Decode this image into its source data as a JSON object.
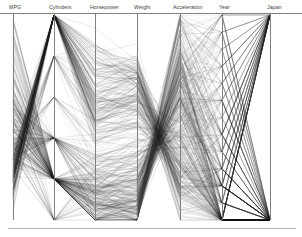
{
  "figure": {
    "kind": "parallel-coordinates-plot",
    "background_color": "#ffffff",
    "line_color": "#1d1d1d",
    "axis_color": "#7a7a7a",
    "label_color": "#3a3a3a"
  },
  "chart_data": {
    "type": "line",
    "title": "",
    "subtitle": "",
    "xlabel": "",
    "ylabel": "",
    "grid": false,
    "legend": "none",
    "plot_kind": "parallel-coordinates",
    "axes": [
      {
        "label": "MPG",
        "x_px": 13,
        "range": [
          9,
          47
        ],
        "ticks": []
      },
      {
        "label": "Cylinders",
        "x_px": 54,
        "range": [
          3,
          8
        ],
        "ticks": []
      },
      {
        "label": "Horsepower",
        "x_px": 95,
        "range": [
          46,
          230
        ],
        "ticks": []
      },
      {
        "label": "Weight",
        "x_px": 137,
        "range": [
          1613,
          5140
        ],
        "ticks": []
      },
      {
        "label": "Acceleration",
        "x_px": 180,
        "range": [
          8,
          24.8
        ],
        "ticks": []
      },
      {
        "label": "Year",
        "x_px": 222,
        "range": [
          70,
          82
        ],
        "ticks": []
      },
      {
        "label": "Japan",
        "x_px": 270,
        "range": [
          0,
          1
        ],
        "ticks": []
      }
    ],
    "axis_labels": [
      "MPG",
      "Cylinders",
      "Horsepower",
      "Weight",
      "Acceleration",
      "Year",
      "Japan"
    ],
    "n_series": 392,
    "series_note": "each polyline is one automobile record crossing all seven axes",
    "series": [
      {
        "name": "record",
        "values": [
          0.3,
          0.0,
          0.2,
          0.22,
          0.52,
          0.0,
          0.0
        ]
      },
      {
        "name": "record",
        "values": [
          0.21,
          1.0,
          0.55,
          0.6,
          0.3,
          0.0,
          0.0
        ]
      },
      {
        "name": "record",
        "values": [
          0.26,
          1.0,
          0.47,
          0.53,
          0.33,
          0.0,
          0.0
        ]
      },
      {
        "name": "record",
        "values": [
          0.24,
          1.0,
          0.45,
          0.52,
          0.4,
          0.0,
          0.0
        ]
      },
      {
        "name": "record",
        "values": [
          0.25,
          1.0,
          0.42,
          0.51,
          0.23,
          0.0,
          0.0
        ]
      },
      {
        "name": "record",
        "values": [
          0.18,
          1.0,
          0.7,
          0.7,
          0.2,
          0.0,
          0.0
        ]
      },
      {
        "name": "record",
        "values": [
          0.16,
          1.0,
          0.78,
          0.74,
          0.14,
          0.0,
          0.0
        ]
      },
      {
        "name": "record",
        "values": [
          0.16,
          1.0,
          0.76,
          0.72,
          0.11,
          0.0,
          0.0
        ]
      },
      {
        "name": "record",
        "values": [
          0.16,
          1.0,
          0.8,
          0.76,
          0.17,
          0.0,
          0.0
        ]
      },
      {
        "name": "record",
        "values": [
          0.21,
          1.0,
          0.59,
          0.62,
          0.17,
          0.0,
          0.0
        ]
      },
      {
        "name": "record",
        "values": [
          0.21,
          1.0,
          0.52,
          0.58,
          0.26,
          0.0,
          0.0
        ]
      },
      {
        "name": "record",
        "values": [
          0.21,
          1.0,
          0.51,
          0.55,
          0.23,
          0.0,
          0.0
        ]
      },
      {
        "name": "record",
        "values": [
          0.21,
          1.0,
          0.55,
          0.59,
          0.2,
          0.0,
          0.0
        ]
      },
      {
        "name": "record",
        "values": [
          0.21,
          1.0,
          0.85,
          0.77,
          0.05,
          0.0,
          0.0
        ]
      },
      {
        "name": "record",
        "values": [
          0.47,
          0.2,
          0.12,
          0.11,
          0.64,
          0.0,
          1.0
        ]
      },
      {
        "name": "record",
        "values": [
          0.38,
          0.2,
          0.17,
          0.18,
          0.63,
          0.0,
          0.0
        ]
      },
      {
        "name": "record",
        "values": [
          0.34,
          0.2,
          0.13,
          0.13,
          0.69,
          0.0,
          0.0
        ]
      },
      {
        "name": "record",
        "values": [
          0.42,
          0.2,
          0.1,
          0.09,
          0.74,
          0.0,
          1.0
        ]
      },
      {
        "name": "record",
        "values": [
          0.55,
          0.2,
          0.07,
          0.05,
          0.8,
          0.0,
          1.0
        ]
      },
      {
        "name": "record",
        "values": [
          0.45,
          0.2,
          0.09,
          0.1,
          0.62,
          0.0,
          0.0
        ]
      },
      {
        "name": "record",
        "values": [
          0.34,
          0.4,
          0.25,
          0.3,
          0.45,
          0.1,
          0.0
        ]
      },
      {
        "name": "record",
        "values": [
          0.32,
          0.4,
          0.28,
          0.33,
          0.42,
          0.1,
          0.0
        ]
      },
      {
        "name": "record",
        "values": [
          0.29,
          0.4,
          0.3,
          0.36,
          0.38,
          0.1,
          0.0
        ]
      },
      {
        "name": "record",
        "values": [
          0.27,
          1.0,
          0.6,
          0.64,
          0.24,
          0.1,
          0.0
        ]
      },
      {
        "name": "record",
        "values": [
          0.24,
          1.0,
          0.66,
          0.68,
          0.2,
          0.1,
          0.0
        ]
      },
      {
        "name": "record",
        "values": [
          0.5,
          0.2,
          0.08,
          0.07,
          0.72,
          0.2,
          1.0
        ]
      },
      {
        "name": "record",
        "values": [
          0.52,
          0.2,
          0.06,
          0.06,
          0.78,
          0.2,
          1.0
        ]
      },
      {
        "name": "record",
        "values": [
          0.4,
          0.2,
          0.14,
          0.16,
          0.6,
          0.2,
          0.0
        ]
      },
      {
        "name": "record",
        "values": [
          0.36,
          0.2,
          0.16,
          0.19,
          0.55,
          0.2,
          0.0
        ]
      },
      {
        "name": "record",
        "values": [
          0.6,
          0.2,
          0.05,
          0.04,
          0.85,
          0.3,
          1.0
        ]
      },
      {
        "name": "record",
        "values": [
          0.66,
          0.2,
          0.04,
          0.03,
          0.88,
          0.4,
          1.0
        ]
      },
      {
        "name": "record",
        "values": [
          0.72,
          0.2,
          0.03,
          0.02,
          0.9,
          0.5,
          1.0
        ]
      },
      {
        "name": "record",
        "values": [
          0.8,
          0.2,
          0.02,
          0.02,
          0.92,
          0.6,
          1.0
        ]
      },
      {
        "name": "record",
        "values": [
          0.88,
          0.2,
          0.02,
          0.01,
          0.95,
          0.8,
          1.0
        ]
      },
      {
        "name": "record",
        "values": [
          0.95,
          0.2,
          0.01,
          0.01,
          0.97,
          1.0,
          1.0
        ]
      },
      {
        "name": "record",
        "values": [
          0.7,
          0.2,
          0.06,
          0.08,
          0.7,
          0.9,
          0.0
        ]
      },
      {
        "name": "record",
        "values": [
          0.62,
          0.2,
          0.09,
          0.12,
          0.66,
          0.9,
          0.0
        ]
      },
      {
        "name": "record",
        "values": [
          0.58,
          0.4,
          0.15,
          0.22,
          0.58,
          0.8,
          0.0
        ]
      },
      {
        "name": "record",
        "values": [
          0.44,
          0.4,
          0.22,
          0.31,
          0.5,
          0.7,
          0.0
        ]
      },
      {
        "name": "record",
        "values": [
          0.3,
          1.0,
          0.55,
          0.62,
          0.28,
          0.3,
          0.0
        ]
      },
      {
        "name": "record",
        "values": [
          0.28,
          1.0,
          0.58,
          0.66,
          0.26,
          0.4,
          0.0
        ]
      },
      {
        "name": "record",
        "values": [
          0.33,
          0.6,
          0.4,
          0.47,
          0.35,
          0.5,
          0.0
        ]
      },
      {
        "name": "record",
        "values": [
          0.37,
          0.6,
          0.36,
          0.44,
          0.41,
          0.6,
          0.0
        ]
      },
      {
        "name": "record",
        "values": [
          0.41,
          0.4,
          0.24,
          0.29,
          0.48,
          0.7,
          0.0
        ]
      },
      {
        "name": "record",
        "values": [
          0.48,
          0.2,
          0.11,
          0.14,
          0.68,
          0.8,
          1.0
        ]
      },
      {
        "name": "record",
        "values": [
          0.54,
          0.2,
          0.08,
          0.09,
          0.76,
          0.9,
          1.0
        ]
      },
      {
        "name": "record",
        "values": [
          0.35,
          0.2,
          0.18,
          0.21,
          0.56,
          0.5,
          0.0
        ]
      },
      {
        "name": "record",
        "values": [
          0.31,
          0.2,
          0.21,
          0.25,
          0.49,
          0.4,
          0.0
        ]
      },
      {
        "name": "record",
        "values": [
          0.22,
          1.0,
          0.68,
          0.71,
          0.18,
          0.2,
          0.0
        ]
      },
      {
        "name": "record",
        "values": [
          0.19,
          1.0,
          0.73,
          0.75,
          0.12,
          0.1,
          0.0
        ]
      }
    ]
  }
}
